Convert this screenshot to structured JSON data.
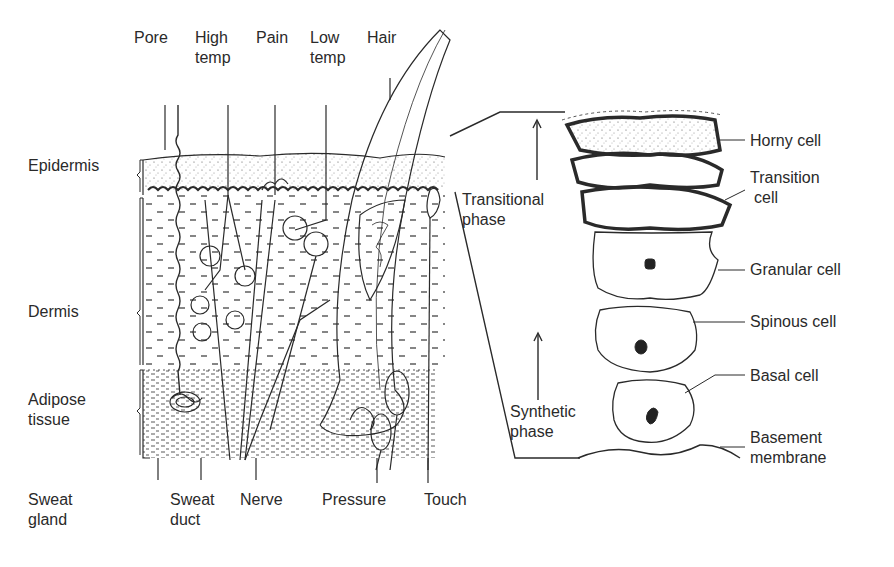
{
  "top_labels": {
    "pore": "Pore",
    "high_temp": [
      "High",
      "temp"
    ],
    "pain": "Pain",
    "low_temp": [
      "Low",
      "temp"
    ],
    "hair": "Hair"
  },
  "left_labels": {
    "epidermis": "Epidermis",
    "dermis": "Dermis",
    "adipose": [
      "Adipose",
      "tissue"
    ]
  },
  "bottom_labels": {
    "sweat_gland": [
      "Sweat",
      "gland"
    ],
    "sweat_duct": [
      "Sweat",
      "duct"
    ],
    "nerve": "Nerve",
    "pressure": "Pressure",
    "touch": "Touch"
  },
  "right_labels": {
    "horny_cell": "Horny cell",
    "transition_cell": [
      "Transition",
      "cell"
    ],
    "granular_cell": "Granular cell",
    "spinous_cell": "Spinous cell",
    "basal_cell": "Basal cell",
    "basement_membrane": [
      "Basement",
      "membrane"
    ]
  },
  "phase_labels": {
    "transitional": [
      "Transitional",
      "phase"
    ],
    "synthetic": [
      "Synthetic",
      "phase"
    ]
  },
  "colors": {
    "ink": "#2a2a2a",
    "background": "#ffffff"
  }
}
